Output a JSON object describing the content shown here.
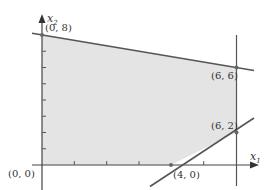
{
  "diagram": {
    "type": "feasible-region",
    "axes": {
      "x_label": "x",
      "x_sub": "1",
      "y_label": "x",
      "y_sub": "2",
      "x_ticks": [
        1,
        2,
        3,
        4,
        5,
        6
      ],
      "y_ticks": [
        1,
        2,
        3,
        4,
        5,
        6,
        7
      ]
    },
    "points": [
      {
        "id": "origin",
        "label": "(0, 0)",
        "x": 0,
        "y": 0
      },
      {
        "id": "p08",
        "label": "(0, 8)",
        "x": 0,
        "y": 8
      },
      {
        "id": "p66",
        "label": "(6, 6)",
        "x": 6,
        "y": 6
      },
      {
        "id": "p62",
        "label": "(6, 2)",
        "x": 6,
        "y": 2
      },
      {
        "id": "p40",
        "label": "(4, 0)",
        "x": 4,
        "y": 0
      }
    ],
    "lines": [
      {
        "id": "top-constraint",
        "through": [
          [
            0,
            8
          ],
          [
            6,
            6
          ]
        ]
      },
      {
        "id": "vertical-constraint",
        "x": 6
      },
      {
        "id": "lower-constraint",
        "through": [
          [
            4,
            0
          ],
          [
            6,
            2
          ]
        ]
      }
    ],
    "region_vertices": [
      [
        0,
        0
      ],
      [
        0,
        8
      ],
      [
        6,
        6
      ],
      [
        6,
        2
      ],
      [
        4,
        0
      ]
    ],
    "colors": {
      "fill": "#e4e4e4",
      "line": "#555555",
      "axis": "#444444",
      "point": "#666666"
    }
  }
}
